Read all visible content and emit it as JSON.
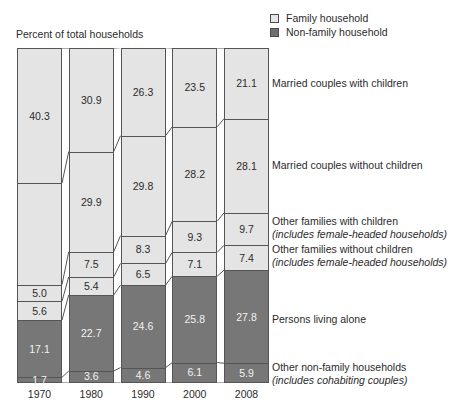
{
  "axis_title": "Percent of total households",
  "legend": {
    "position": "top-right",
    "items": [
      {
        "label": "Family household",
        "color": "#e6e6e6",
        "key": "family"
      },
      {
        "label": "Non-family household",
        "color": "#6f6f6f",
        "key": "nonfamily"
      }
    ]
  },
  "categories_labels": [
    {
      "name": "Married couples with children",
      "sub": ""
    },
    {
      "name": "Married couples without children",
      "sub": ""
    },
    {
      "name": "Other families with children",
      "sub": "(includes female-headed households)"
    },
    {
      "name": "Other families without children",
      "sub": "(includes female-headed households)"
    },
    {
      "name": "Persons living alone",
      "sub": ""
    },
    {
      "name": "Other non-family households",
      "sub": "(includes cohabiting couples)"
    }
  ],
  "chart_data": {
    "type": "bar",
    "title": "",
    "subtitle": "",
    "xlabel": "",
    "ylabel": "Percent of total households",
    "ylim": [
      0,
      100
    ],
    "grid": false,
    "stacked": true,
    "legend_position": "top-right",
    "categories": [
      "1970",
      "1980",
      "1990",
      "2000",
      "2008"
    ],
    "series": [
      {
        "name": "Married couples with children",
        "group": "Family household",
        "color": "#e4e4e4",
        "values": [
          40.3,
          30.9,
          26.3,
          23.5,
          21.1
        ],
        "labels": [
          "40.3",
          "30.9",
          "26.3",
          "23.5",
          "21.1"
        ]
      },
      {
        "name": "Married couples without children",
        "group": "Family household",
        "color": "#e4e4e4",
        "values": [
          30.3,
          29.9,
          29.8,
          28.2,
          28.1
        ],
        "labels": [
          "",
          "29.9",
          "29.8",
          "28.2",
          "28.1"
        ]
      },
      {
        "name": "Other families with children",
        "group": "Family household",
        "color": "#e4e4e4",
        "values": [
          5.0,
          7.5,
          8.3,
          9.3,
          9.7
        ],
        "labels": [
          "5.0",
          "7.5",
          "8.3",
          "9.3",
          "9.7"
        ]
      },
      {
        "name": "Other families without children",
        "group": "Family household",
        "color": "#e4e4e4",
        "values": [
          5.6,
          5.4,
          6.5,
          7.1,
          7.4
        ],
        "labels": [
          "5.6",
          "5.4",
          "6.5",
          "7.1",
          "7.4"
        ]
      },
      {
        "name": "Persons living alone",
        "group": "Non-family household",
        "color": "#777777",
        "values": [
          17.1,
          22.7,
          24.6,
          25.8,
          27.8
        ],
        "labels": [
          "17.1",
          "22.7",
          "24.6",
          "25.8",
          "27.8"
        ]
      },
      {
        "name": "Other non-family households",
        "group": "Non-family household",
        "color": "#777777",
        "values": [
          1.7,
          3.6,
          4.6,
          6.1,
          5.9
        ],
        "labels": [
          "1.7",
          "3.6",
          "4.6",
          "6.1",
          "5.9"
        ]
      }
    ],
    "note_1970_second_segment_unlabeled": true
  }
}
